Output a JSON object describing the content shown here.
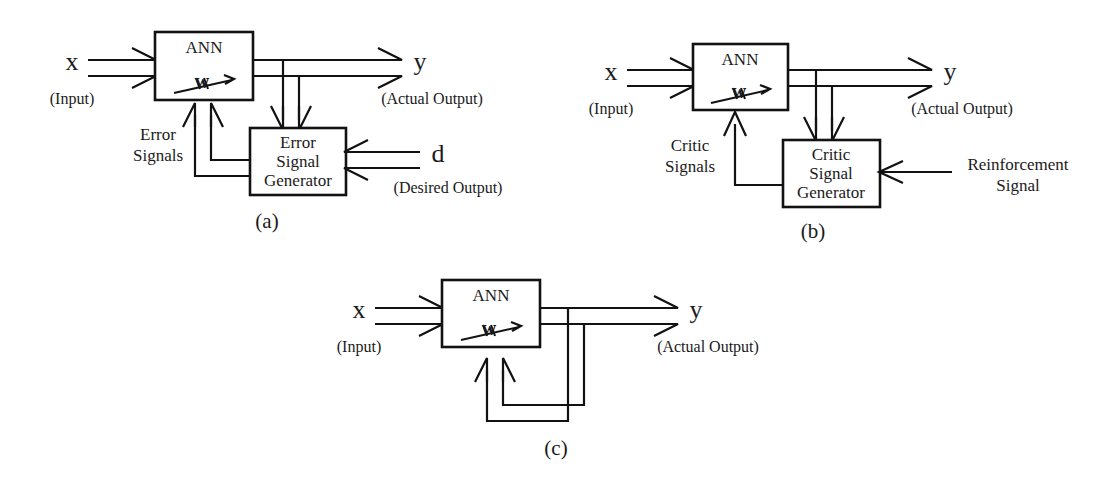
{
  "figure": {
    "background_color": "#ffffff",
    "line_color": "#121212",
    "text_color": "#1a1a1a"
  },
  "panels": [
    {
      "id": "a",
      "caption": "(a)",
      "paradigm": "supervised-learning",
      "blocks": [
        {
          "name": "ann-block",
          "label": "ANN",
          "weight_symbol": "w"
        },
        {
          "name": "error-signal-generator-block",
          "label_lines": [
            "Error",
            "Signal",
            "Generator"
          ]
        }
      ],
      "signals": [
        {
          "name": "input-signal",
          "symbol": "x",
          "caption": "(Input)",
          "style": "double"
        },
        {
          "name": "output-signal",
          "symbol": "y",
          "caption": "(Actual Output)",
          "style": "double"
        },
        {
          "name": "desired-output-signal",
          "symbol": "d",
          "caption": "(Desired Output)",
          "style": "double"
        },
        {
          "name": "error-signals-feedback",
          "label_lines": [
            "Error",
            "Signals"
          ],
          "style": "double"
        }
      ]
    },
    {
      "id": "b",
      "caption": "(b)",
      "paradigm": "reinforcement-learning",
      "blocks": [
        {
          "name": "ann-block",
          "label": "ANN",
          "weight_symbol": "w"
        },
        {
          "name": "critic-signal-generator-block",
          "label_lines": [
            "Critic",
            "Signal",
            "Generator"
          ]
        }
      ],
      "signals": [
        {
          "name": "input-signal",
          "symbol": "x",
          "caption": "(Input)",
          "style": "double"
        },
        {
          "name": "output-signal",
          "symbol": "y",
          "caption": "(Actual Output)",
          "style": "double"
        },
        {
          "name": "reinforcement-signal",
          "label_lines": [
            "Reinforcement",
            "Signal"
          ],
          "style": "single"
        },
        {
          "name": "critic-signals-feedback",
          "label_lines": [
            "Critic",
            "Signals"
          ],
          "style": "single"
        }
      ]
    },
    {
      "id": "c",
      "caption": "(c)",
      "paradigm": "unsupervised-learning",
      "blocks": [
        {
          "name": "ann-block",
          "label": "ANN",
          "weight_symbol": "w"
        }
      ],
      "signals": [
        {
          "name": "input-signal",
          "symbol": "x",
          "caption": "(Input)",
          "style": "double"
        },
        {
          "name": "output-signal",
          "symbol": "y",
          "caption": "(Actual Output)",
          "style": "double"
        },
        {
          "name": "self-feedback-loop",
          "style": "double"
        }
      ]
    }
  ],
  "labels": {
    "ann": "ANN",
    "weight": "w",
    "x": "x",
    "y": "y",
    "d": "d",
    "input_caption": "(Input)",
    "actual_output_caption": "(Actual Output)",
    "desired_output_caption": "(Desired Output)",
    "error_line1": "Error",
    "error_line2": "Signal",
    "error_line3": "Generator",
    "error_sig_line1": "Error",
    "error_sig_line2": "Signals",
    "critic_line1": "Critic",
    "critic_line2": "Signal",
    "critic_line3": "Generator",
    "critic_sig_line1": "Critic",
    "critic_sig_line2": "Signals",
    "reinforcement_line1": "Reinforcement",
    "reinforcement_line2": "Signal",
    "panel_a": "(a)",
    "panel_b": "(b)",
    "panel_c": "(c)"
  }
}
